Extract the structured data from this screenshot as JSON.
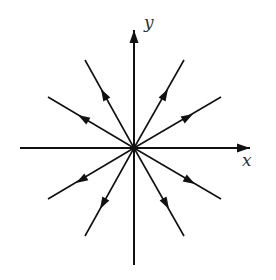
{
  "diagram": {
    "type": "radial-vector-field",
    "origin": {
      "x": 134,
      "y": 148
    },
    "stroke_color": "#111111",
    "label_color": "#333333",
    "axes": {
      "x": {
        "label": "x",
        "from": [
          20,
          148
        ],
        "to": [
          250,
          148
        ],
        "arrow_at_end": true,
        "label_pos": [
          242,
          166
        ]
      },
      "y": {
        "label": "y",
        "from": [
          134,
          265
        ],
        "to": [
          134,
          30
        ],
        "arrow_at_end": true,
        "label_pos": [
          144,
          28
        ]
      }
    },
    "rays": [
      {
        "name": "upper-left-steep",
        "end": [
          85,
          60
        ],
        "arrow": [
          101,
          89
        ],
        "direction": "outward"
      },
      {
        "name": "upper-left-shallow",
        "end": [
          48,
          97
        ],
        "arrow": [
          78,
          115
        ],
        "direction": "outward"
      },
      {
        "name": "upper-right-steep",
        "end": [
          184,
          60
        ],
        "arrow": [
          168,
          89
        ],
        "direction": "outward"
      },
      {
        "name": "upper-right-shallow",
        "end": [
          221,
          97
        ],
        "arrow": [
          193,
          114
        ],
        "direction": "outward"
      },
      {
        "name": "lower-left-shallow",
        "end": [
          48,
          199
        ],
        "arrow": [
          76,
          183
        ],
        "direction": "outward"
      },
      {
        "name": "lower-left-steep",
        "end": [
          85,
          236
        ],
        "arrow": [
          100,
          209
        ],
        "direction": "outward"
      },
      {
        "name": "lower-right-shallow",
        "end": [
          221,
          199
        ],
        "arrow": [
          195,
          184
        ],
        "direction": "outward"
      },
      {
        "name": "lower-right-steep",
        "end": [
          184,
          236
        ],
        "arrow": [
          169,
          209
        ],
        "direction": "outward"
      }
    ]
  }
}
